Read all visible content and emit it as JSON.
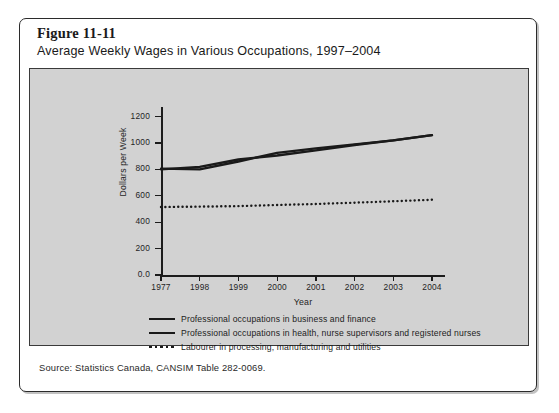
{
  "figure": {
    "number": "Figure 11-11",
    "title": "Average Weekly Wages in Various Occupations, 1997–2004",
    "source": "Source: Statistics Canada, CANSIM Table 282-0069."
  },
  "chart_data": {
    "type": "line",
    "title": "Average Weekly Wages in Various Occupations, 1997–2004",
    "xlabel": "Year",
    "ylabel": "Dollars per Week",
    "x": [
      "1977",
      "1998",
      "1999",
      "2000",
      "2001",
      "2002",
      "2003",
      "2004"
    ],
    "xtick_labels": [
      "1977",
      "1998",
      "1999",
      "2000",
      "2001",
      "2002",
      "2003",
      "2004"
    ],
    "ytick_labels": [
      "0.0",
      "200",
      "400",
      "600",
      "800",
      "1000",
      "1200"
    ],
    "ytick_values": [
      0,
      200,
      400,
      600,
      800,
      1000,
      1200
    ],
    "ylim": [
      0,
      1250
    ],
    "grid": false,
    "legend_position": "below-plot",
    "series": [
      {
        "name": "Professional occupations in business and finance",
        "style": "solid",
        "color": "#1a1a1a",
        "values": [
          805,
          800,
          860,
          925,
          960,
          990,
          1020,
          1060
        ]
      },
      {
        "name": "Professional occupations in health, nurse supervisors and registered nurses",
        "style": "solid",
        "color": "#1a1a1a",
        "values": [
          800,
          820,
          875,
          905,
          945,
          985,
          1020,
          1060
        ]
      },
      {
        "name": "Labourer in processing, manufacturing and utilities",
        "style": "dotted",
        "color": "#1a1a1a",
        "values": [
          515,
          518,
          522,
          530,
          538,
          548,
          558,
          570
        ]
      }
    ]
  },
  "legend": {
    "items": [
      {
        "label": "Professional occupations in business and finance",
        "style": "solid"
      },
      {
        "label": "Professional occupations in health, nurse supervisors and registered nurses",
        "style": "solid"
      },
      {
        "label": "Labourer in processing, manufacturing and utilities",
        "style": "dotted"
      }
    ]
  }
}
